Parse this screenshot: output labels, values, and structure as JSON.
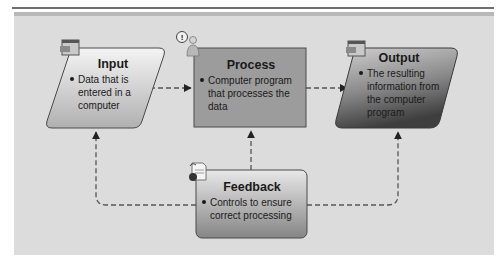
{
  "diagram": {
    "type": "flowchart",
    "colors": {
      "panel": "#dcdcdc",
      "input_fill_top": "#f2f2f2",
      "input_fill_bottom": "#b4b4b4",
      "process_fill": "#9c9c9c",
      "output_fill_top": "#c8c8c8",
      "output_fill_bottom": "#4a4a4a",
      "feedback_fill_top": "#e6e6e6",
      "feedback_fill_bottom": "#8a8a8a",
      "connector": "#555555"
    },
    "nodes": {
      "input": {
        "title": "Input",
        "bullet": "Data that is entered in a computer",
        "icon": "window-icon"
      },
      "process": {
        "title": "Process",
        "bullet": "Computer program that processes the data",
        "icon": "person-thinking-icon"
      },
      "output": {
        "title": "Output",
        "bullet": "The resulting information from the computer program",
        "icon": "window-icon"
      },
      "feedback": {
        "title": "Feedback",
        "bullet": "Controls to ensure correct processing",
        "icon": "document-info-icon"
      }
    },
    "edges": [
      {
        "from": "input",
        "to": "process",
        "style": "dashed-arrow"
      },
      {
        "from": "process",
        "to": "output",
        "style": "dashed-arrow"
      },
      {
        "from": "feedback",
        "to": "input",
        "style": "dashed-arrow"
      },
      {
        "from": "feedback",
        "to": "process",
        "style": "dashed-arrow"
      },
      {
        "from": "feedback",
        "to": "output",
        "style": "dashed-arrow"
      }
    ]
  }
}
